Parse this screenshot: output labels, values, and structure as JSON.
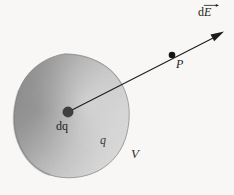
{
  "figure": {
    "kind": "physics-diagram",
    "caption_labels": {
      "charge_element": "dq",
      "total_charge": "q",
      "volume": "V",
      "field_point": "P",
      "field_vector_prefix": "d",
      "field_vector_symbol": "E"
    },
    "colors": {
      "background": "#f8f7f5",
      "blob_dark": "#9a9a9a",
      "blob_light": "#dcdcdc",
      "blob_edge": "#8d8d8d",
      "ink": "#1c1c1c",
      "dot_fill": "#3d3d3d"
    },
    "geometry": {
      "blob_center_x": 72,
      "blob_center_y": 116,
      "dq_point": [
        68,
        112
      ],
      "p_point": [
        172,
        55
      ],
      "arrow_tip": [
        224,
        32
      ]
    }
  }
}
